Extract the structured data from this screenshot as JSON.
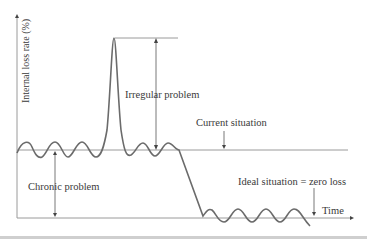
{
  "diagram": {
    "y_axis_label": "Internal loss rate (%)",
    "x_axis_label": "Time",
    "annotations": {
      "irregular": "Irregular problem",
      "current": "Current situation",
      "chronic": "Chronic problem",
      "ideal": "Ideal situation = zero loss"
    },
    "colors": {
      "curve": "#6b6b6b",
      "lines": "#8a8a8a",
      "text": "#3a3a3a"
    }
  }
}
